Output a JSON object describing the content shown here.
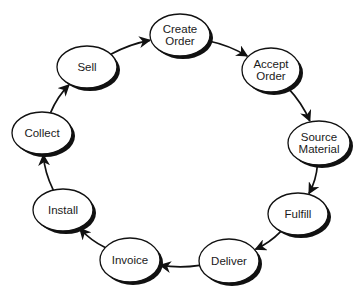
{
  "diagram": {
    "type": "cycle",
    "colors": {
      "stroke": "#111111",
      "fill": "#ffffff",
      "shadow": "#111111",
      "text": "#1a1a1a"
    },
    "nodes": [
      {
        "id": "create-order",
        "lines": [
          "Create",
          "Order"
        ]
      },
      {
        "id": "accept-order",
        "lines": [
          "Accept",
          "Order"
        ]
      },
      {
        "id": "source-material",
        "lines": [
          "Source",
          "Material"
        ]
      },
      {
        "id": "fulfill",
        "lines": [
          "Fulfill"
        ]
      },
      {
        "id": "deliver",
        "lines": [
          "Deliver"
        ]
      },
      {
        "id": "invoice",
        "lines": [
          "Invoice"
        ]
      },
      {
        "id": "install",
        "lines": [
          "Install"
        ]
      },
      {
        "id": "collect",
        "lines": [
          "Collect"
        ]
      },
      {
        "id": "sell",
        "lines": [
          "Sell"
        ]
      }
    ],
    "edges": [
      {
        "from": "create-order",
        "to": "accept-order"
      },
      {
        "from": "accept-order",
        "to": "source-material"
      },
      {
        "from": "source-material",
        "to": "fulfill"
      },
      {
        "from": "fulfill",
        "to": "deliver"
      },
      {
        "from": "deliver",
        "to": "invoice"
      },
      {
        "from": "invoice",
        "to": "install"
      },
      {
        "from": "install",
        "to": "collect"
      },
      {
        "from": "collect",
        "to": "sell"
      },
      {
        "from": "sell",
        "to": "create-order"
      }
    ]
  }
}
